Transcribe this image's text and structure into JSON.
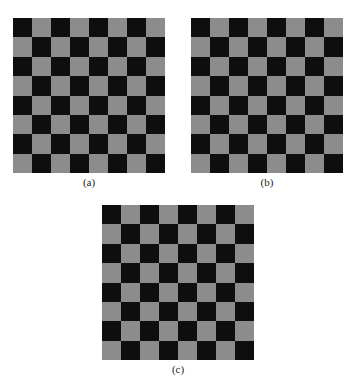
{
  "figure": {
    "panels": [
      {
        "id": "a",
        "caption": "(a)",
        "rows": 8,
        "cols": 8,
        "top_left": "dark"
      },
      {
        "id": "b",
        "caption": "(b)",
        "rows": 8,
        "cols": 8,
        "top_left": "dark"
      },
      {
        "id": "c",
        "caption": "(c)",
        "rows": 8,
        "cols": 8,
        "top_left": "dark"
      }
    ],
    "colors": {
      "dark": "#0e0e0e",
      "light": "#8c8c8c"
    }
  }
}
